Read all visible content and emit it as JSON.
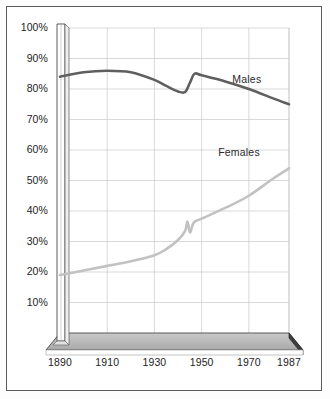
{
  "chart_data": {
    "type": "line",
    "title": "",
    "subtitle": "",
    "xlabel": "",
    "ylabel": "",
    "xlim": [
      1890,
      1987
    ],
    "ylim": [
      0,
      100
    ],
    "grid": true,
    "legend_position": "inline-annotation",
    "y_ticks": [
      10,
      20,
      30,
      40,
      50,
      60,
      70,
      80,
      90,
      100
    ],
    "y_tick_labels": [
      "10%",
      "20%",
      "30%",
      "40%",
      "50%",
      "60%",
      "70%",
      "80%",
      "90%",
      "100%"
    ],
    "x_ticks": [
      1890,
      1910,
      1930,
      1950,
      1970,
      1987
    ],
    "x_tick_labels": [
      "1890",
      "1910",
      "1930",
      "1950",
      "1970",
      "1987"
    ],
    "series": [
      {
        "name": "Males",
        "color": "#5f5f5f",
        "label_x": 1963,
        "label_y": 83,
        "x": [
          1890,
          1900,
          1910,
          1920,
          1930,
          1935,
          1940,
          1943,
          1945,
          1947,
          1950,
          1960,
          1970,
          1980,
          1987
        ],
        "values": [
          84,
          85.5,
          86,
          85.5,
          83,
          81,
          79.2,
          79,
          82,
          85,
          84.5,
          82.5,
          80,
          77,
          75
        ]
      },
      {
        "name": "Females",
        "color": "#c2c2c2",
        "label_x": 1957,
        "label_y": 59,
        "x": [
          1890,
          1900,
          1910,
          1920,
          1930,
          1935,
          1940,
          1943,
          1944,
          1945,
          1946,
          1947,
          1950,
          1960,
          1970,
          1980,
          1987
        ],
        "values": [
          19,
          20.5,
          22,
          23.5,
          25.5,
          27.5,
          30.5,
          33.5,
          36.5,
          33,
          35,
          36.5,
          37.5,
          41,
          45,
          50.5,
          54
        ]
      }
    ]
  },
  "axis": {
    "y_axis_name": "percent-axis",
    "x_axis_name": "year-axis"
  }
}
